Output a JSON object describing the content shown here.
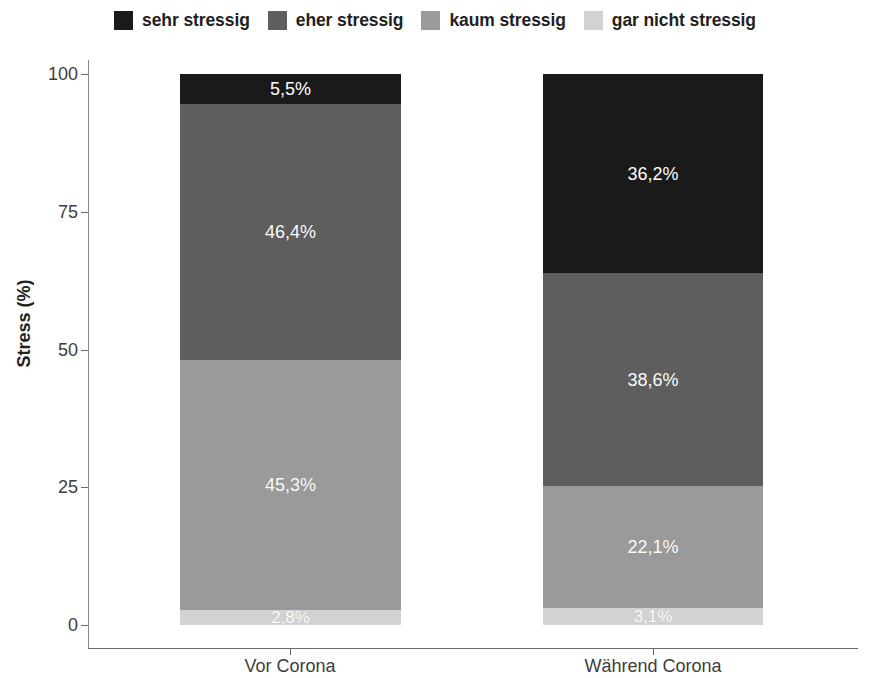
{
  "chart_data": {
    "type": "bar",
    "subtype": "stacked-bar-100",
    "title": "",
    "xlabel": "",
    "ylabel": "Stress (%)",
    "ylim": [
      0,
      100
    ],
    "yticks": [
      "0",
      "25",
      "50",
      "75",
      "100"
    ],
    "ytick_values": [
      0,
      25,
      50,
      75,
      100
    ],
    "grid": false,
    "legend_position": "top-center",
    "categories": [
      "Vor Corona",
      "Während Corona"
    ],
    "series": [
      {
        "name": "sehr stressig",
        "color": "#1a1a1a",
        "values": [
          5.5,
          36.2
        ],
        "labels": [
          "5,5%",
          "36,2%"
        ]
      },
      {
        "name": "eher stressig",
        "color": "#5e5e5e",
        "values": [
          46.4,
          38.6
        ],
        "labels": [
          "46,4%",
          "38,6%"
        ]
      },
      {
        "name": "kaum stressig",
        "color": "#9a9a9a",
        "values": [
          45.3,
          22.1
        ],
        "labels": [
          "45,3%",
          "22,1%"
        ]
      },
      {
        "name": "gar nicht stressig",
        "color": "#d2d2d2",
        "values": [
          2.8,
          3.1
        ],
        "labels": [
          "2,8%",
          "3,1%"
        ]
      }
    ]
  },
  "legend": {
    "items": [
      {
        "label": "sehr stressig",
        "color": "#1a1a1a",
        "swatch_name": "legend-swatch-sehr-stressig"
      },
      {
        "label": "eher stressig",
        "color": "#5e5e5e",
        "swatch_name": "legend-swatch-eher-stressig"
      },
      {
        "label": "kaum stressig",
        "color": "#9a9a9a",
        "swatch_name": "legend-swatch-kaum-stressig"
      },
      {
        "label": "gar nicht stressig",
        "color": "#d2d2d2",
        "swatch_name": "legend-swatch-gar-nicht-stressig"
      }
    ]
  },
  "axes": {
    "y_title": "Stress (%)",
    "y_ticks": [
      "100",
      "75",
      "50",
      "25",
      "0"
    ],
    "x_categories": [
      "Vor Corona",
      "Während Corona"
    ]
  },
  "bars": [
    {
      "category": "Vor Corona",
      "segments": [
        {
          "series": "sehr stressig",
          "label": "5,5%",
          "value": 5.5,
          "color": "#1a1a1a"
        },
        {
          "series": "eher stressig",
          "label": "46,4%",
          "value": 46.4,
          "color": "#5e5e5e"
        },
        {
          "series": "kaum stressig",
          "label": "45,3%",
          "value": 45.3,
          "color": "#9a9a9a"
        },
        {
          "series": "gar nicht stressig",
          "label": "2,8%",
          "value": 2.8,
          "color": "#d2d2d2"
        }
      ]
    },
    {
      "category": "Während Corona",
      "segments": [
        {
          "series": "sehr stressig",
          "label": "36,2%",
          "value": 36.2,
          "color": "#1a1a1a"
        },
        {
          "series": "eher stressig",
          "label": "38,6%",
          "value": 38.6,
          "color": "#5e5e5e"
        },
        {
          "series": "kaum stressig",
          "label": "22,1%",
          "value": 22.1,
          "color": "#9a9a9a"
        },
        {
          "series": "gar nicht stressig",
          "label": "3,1%",
          "value": 3.1,
          "color": "#d2d2d2"
        }
      ]
    }
  ]
}
